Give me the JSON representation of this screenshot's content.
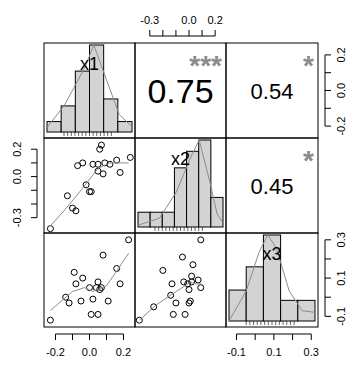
{
  "chart_data": {
    "type": "scatter",
    "subtype": "correlation-matrix (pairs panel)",
    "variables": [
      "x1",
      "x2",
      "x3"
    ],
    "layout": {
      "grid": false,
      "legend": "none",
      "panel_left": 44,
      "panel_top": 43,
      "panel_right": 318,
      "panel_bottom": 327
    },
    "correlations": [
      {
        "row": 0,
        "col": 1,
        "value": "0.75",
        "stars": "***"
      },
      {
        "row": 0,
        "col": 2,
        "value": "0.54",
        "stars": "*"
      },
      {
        "row": 1,
        "col": 2,
        "value": "0.45",
        "stars": "*"
      }
    ],
    "axes": {
      "top_x2": {
        "ticks": [
          -0.3,
          -0.2,
          -0.1,
          0.0,
          0.1,
          0.2
        ],
        "labels": [
          "-0.3",
          "0.0",
          "0.2"
        ],
        "label_values": [
          -0.3,
          0.0,
          0.2
        ],
        "range": [
          -0.39,
          0.26
        ]
      },
      "right_x1": {
        "ticks": [
          0.2,
          0.1,
          0.0,
          -0.1,
          -0.2
        ],
        "labels": [
          "0.2",
          "0.0",
          "-0.2"
        ],
        "label_values": [
          0.2,
          0.0,
          -0.2
        ],
        "range": [
          -0.26,
          0.28
        ]
      },
      "left_x2": {
        "ticks": [
          0.2,
          0.1,
          0.0,
          -0.1,
          -0.2,
          -0.3
        ],
        "labels": [
          "0.2",
          "0.0",
          "-0.3"
        ],
        "label_values": [
          0.2,
          0.0,
          -0.3
        ],
        "range": [
          -0.39,
          0.26
        ]
      },
      "bottom_x1": {
        "ticks": [
          -0.2,
          -0.1,
          0.0,
          0.1,
          0.2
        ],
        "labels": [
          "-0.2",
          "0.0",
          "0.2"
        ],
        "label_values": [
          -0.2,
          0.0,
          0.2
        ],
        "range": [
          -0.25,
          0.25
        ]
      },
      "bottom_x3": {
        "ticks": [
          -0.1,
          0.0,
          0.1,
          0.2,
          0.3
        ],
        "labels": [
          "-0.1",
          "0.1",
          "0.3"
        ],
        "label_values": [
          -0.1,
          0.1,
          0.3
        ],
        "range": [
          -0.14,
          0.32
        ]
      },
      "right_x3": {
        "ticks": [
          0.3,
          0.2,
          0.1,
          0.0,
          -0.1
        ],
        "labels": [
          "0.3",
          "0.1",
          "-0.1"
        ],
        "label_values": [
          0.3,
          0.1,
          -0.1
        ],
        "range": [
          -0.14,
          0.32
        ]
      }
    },
    "histograms": [
      {
        "var": "x1",
        "heights": [
          0.12,
          0.3,
          0.7,
          1.0,
          0.38,
          0.12
        ],
        "density": [
          [
            0,
            0.05
          ],
          [
            0.2,
            0.3
          ],
          [
            0.45,
            0.75
          ],
          [
            0.55,
            1.0
          ],
          [
            0.7,
            0.6
          ],
          [
            0.85,
            0.2
          ],
          [
            1,
            0.06
          ]
        ]
      },
      {
        "var": "x2",
        "heights": [
          0.17,
          0.17,
          0.17,
          0.68,
          0.87,
          1.0,
          0.34
        ],
        "density": [
          [
            0,
            0.02
          ],
          [
            0.25,
            0.1
          ],
          [
            0.45,
            0.4
          ],
          [
            0.62,
            0.8
          ],
          [
            0.72,
            1.0
          ],
          [
            0.85,
            0.5
          ],
          [
            0.93,
            0.15
          ],
          [
            1,
            0.05
          ]
        ]
      },
      {
        "var": "x3",
        "heights": [
          0.36,
          0.63,
          1.0,
          0.24,
          0.24
        ],
        "density": [
          [
            0,
            0.0
          ],
          [
            0.2,
            0.35
          ],
          [
            0.35,
            0.8
          ],
          [
            0.45,
            1.0
          ],
          [
            0.55,
            0.85
          ],
          [
            0.7,
            0.35
          ],
          [
            0.85,
            0.12
          ],
          [
            1,
            0.1
          ]
        ]
      }
    ],
    "scatter": [
      {
        "row": 1,
        "col": 0,
        "xvar": "x1",
        "yvar": "x2",
        "points": [
          [
            -0.23,
            -0.38
          ],
          [
            -0.13,
            -0.14
          ],
          [
            -0.1,
            -0.23
          ],
          [
            -0.08,
            -0.25
          ],
          [
            -0.07,
            0.08
          ],
          [
            -0.04,
            0.1
          ],
          [
            -0.02,
            -0.06
          ],
          [
            0.0,
            -0.11
          ],
          [
            0.01,
            -0.11
          ],
          [
            0.02,
            0.09
          ],
          [
            0.05,
            0.09
          ],
          [
            0.05,
            0.04
          ],
          [
            0.06,
            0.2
          ],
          [
            0.07,
            0.23
          ],
          [
            0.08,
            0.02
          ],
          [
            0.09,
            0.1
          ],
          [
            0.12,
            0.09
          ],
          [
            0.16,
            0.12
          ],
          [
            0.18,
            0.03
          ],
          [
            0.24,
            0.14
          ]
        ],
        "smooth": [
          [
            -0.23,
            -0.36
          ],
          [
            -0.15,
            -0.25
          ],
          [
            -0.05,
            -0.1
          ],
          [
            0.05,
            0.06
          ],
          [
            0.12,
            0.1
          ],
          [
            0.23,
            0.1
          ]
        ]
      },
      {
        "row": 2,
        "col": 0,
        "xvar": "x1",
        "yvar": "x3",
        "points": [
          [
            -0.23,
            -0.12
          ],
          [
            -0.14,
            0.0
          ],
          [
            -0.12,
            -0.03
          ],
          [
            -0.09,
            0.13
          ],
          [
            -0.08,
            0.07
          ],
          [
            -0.04,
            0.1
          ],
          [
            -0.05,
            -0.02
          ],
          [
            0.0,
            0.05
          ],
          [
            0.01,
            -0.09
          ],
          [
            0.02,
            -0.01
          ],
          [
            0.04,
            0.05
          ],
          [
            0.05,
            0.08
          ],
          [
            0.06,
            0.04
          ],
          [
            0.07,
            0.05
          ],
          [
            0.05,
            -0.09
          ],
          [
            0.08,
            0.22
          ],
          [
            0.11,
            -0.02
          ],
          [
            0.16,
            0.15
          ],
          [
            0.18,
            0.07
          ],
          [
            0.23,
            0.3
          ]
        ],
        "smooth": [
          [
            -0.23,
            -0.07
          ],
          [
            -0.1,
            0.03
          ],
          [
            -0.03,
            0.05
          ],
          [
            0.02,
            0.03
          ],
          [
            0.1,
            0.06
          ],
          [
            0.17,
            0.15
          ],
          [
            0.23,
            0.23
          ]
        ]
      },
      {
        "row": 2,
        "col": 1,
        "xvar": "x2",
        "yvar": "x3",
        "points": [
          [
            -0.38,
            -0.12
          ],
          [
            -0.27,
            -0.05
          ],
          [
            -0.2,
            0.14
          ],
          [
            -0.13,
            0.07
          ],
          [
            -0.12,
            -0.09
          ],
          [
            -0.14,
            0.01
          ],
          [
            -0.1,
            -0.03
          ],
          [
            -0.05,
            0.21
          ],
          [
            -0.04,
            0.08
          ],
          [
            -0.03,
            -0.09
          ],
          [
            -0.01,
            0.07
          ],
          [
            0.0,
            0.04
          ],
          [
            0.0,
            -0.03
          ],
          [
            0.01,
            -0.02
          ],
          [
            0.02,
            0.08
          ],
          [
            0.03,
            0.17
          ],
          [
            0.02,
            0.11
          ],
          [
            0.07,
            0.09
          ],
          [
            0.09,
            0.05
          ],
          [
            0.09,
            0.3
          ]
        ],
        "smooth": [
          [
            -0.38,
            -0.12
          ],
          [
            -0.25,
            -0.04
          ],
          [
            -0.12,
            0.02
          ],
          [
            -0.03,
            0.06
          ],
          [
            0.01,
            0.08
          ],
          [
            0.05,
            0.07
          ],
          [
            0.09,
            0.07
          ]
        ]
      }
    ],
    "diag_labels": [
      "x1",
      "x2",
      "x3"
    ],
    "colors": {
      "bar_fill": "#d3d3d3",
      "stars": "#8c8c8c",
      "smooth": "#8c8c8c",
      "axis": "#000000"
    }
  }
}
